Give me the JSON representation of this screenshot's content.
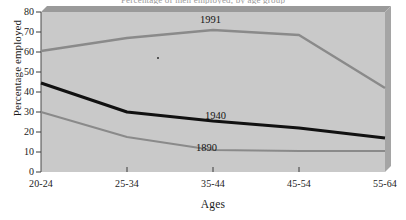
{
  "title_clipped": "Percentage of men employed, by age group",
  "axes": {
    "ylabel": "Percentage employed",
    "xlabel": "Ages",
    "yticks": [
      "0",
      "10",
      "20",
      "30",
      "40",
      "50",
      "60",
      "70",
      "80"
    ],
    "xticks": [
      "20-24",
      "25-34",
      "35-44",
      "45-54",
      "55-64"
    ]
  },
  "labels": {
    "s1991": "1991",
    "s1940": "1940",
    "s1890": "1890"
  },
  "colors": {
    "plot_background": "#c9c9c9",
    "bevel_top": "#9a9a9a",
    "bevel_right": "#a5a5a5",
    "line_gray": "#8a8a8a",
    "line_black": "#111111",
    "text": "#1a1a1a"
  },
  "chart_data": {
    "type": "line",
    "title": "Percentage of men employed, by age group",
    "xlabel": "Ages",
    "ylabel": "Percentage employed",
    "categories": [
      "20-24",
      "25-34",
      "35-44",
      "45-54",
      "55-64"
    ],
    "ylim": [
      0,
      80
    ],
    "ytick_step": 10,
    "grid": false,
    "legend": "inline-annotations",
    "series": [
      {
        "name": "1991",
        "color": "#8a8a8a",
        "width": 2.4,
        "values": [
          60.5,
          67.0,
          71.0,
          68.5,
          42.0
        ]
      },
      {
        "name": "1940",
        "color": "#111111",
        "width": 3.0,
        "values": [
          44.5,
          30.0,
          25.5,
          22.0,
          17.0
        ]
      },
      {
        "name": "1890",
        "color": "#8a8a8a",
        "width": 2.0,
        "values": [
          30.0,
          17.5,
          11.0,
          10.5,
          10.5
        ]
      }
    ]
  }
}
